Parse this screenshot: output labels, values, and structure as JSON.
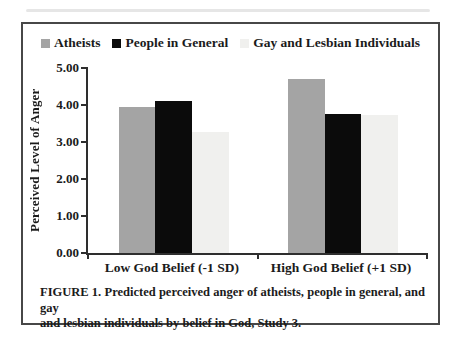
{
  "figure": {
    "caption_lines": [
      "FIGURE 1. Predicted perceived anger of atheists, people in general, and gay",
      "and lesbian individuals by belief in God, Study 3."
    ]
  },
  "chart_data": {
    "type": "bar",
    "title": "",
    "xlabel": "",
    "ylabel": "Perceived Level of Anger",
    "ylim": [
      0,
      5
    ],
    "yticks": [
      "5.00",
      "4.00",
      "3.00",
      "2.00",
      "1.00",
      "0.00"
    ],
    "ytick_values": [
      5,
      4,
      3,
      2,
      1,
      0
    ],
    "categories": [
      "Low God Belief (-1 SD)",
      "High God Belief (+1 SD)"
    ],
    "series": [
      {
        "name": "Atheists",
        "color": "#a4a4a4",
        "values": [
          3.95,
          4.7
        ]
      },
      {
        "name": "People in General",
        "color": "#0b0b0b",
        "values": [
          4.12,
          3.77
        ]
      },
      {
        "name": "Gay and Lesbian Individuals",
        "color": "#f0f0ee",
        "values": [
          3.28,
          3.72
        ]
      }
    ],
    "legend_position": "top",
    "grid": false
  },
  "colors": {
    "frame_border": "#474747",
    "axis": "#2e2e2e",
    "text": "#1b1b1b"
  }
}
